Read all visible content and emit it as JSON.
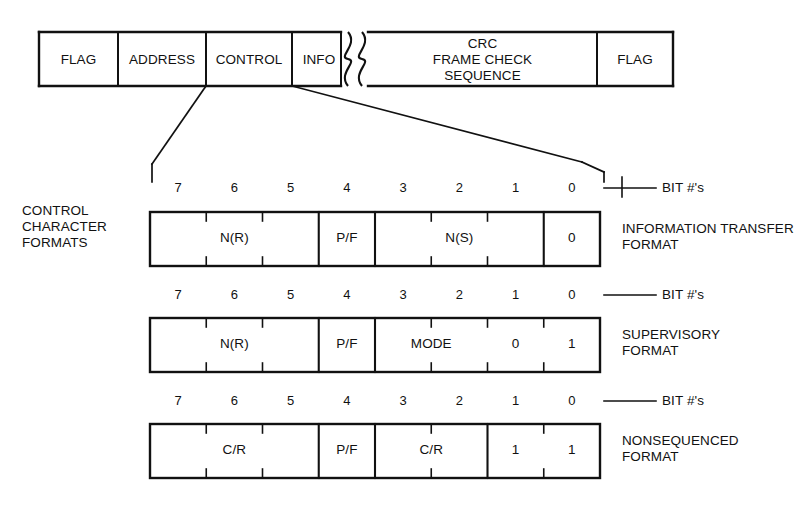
{
  "diagram": {
    "side_title": "CONTROL\nCHARACTER\nFORMATS",
    "bitnum_label": "BIT #'s"
  },
  "frame": {
    "name": "hdlc-frame",
    "fields": [
      {
        "label": "FLAG",
        "x": 39,
        "w": 79
      },
      {
        "label": "ADDRESS",
        "x": 118,
        "w": 88
      },
      {
        "label": "CONTROL",
        "x": 206,
        "w": 86
      },
      {
        "label": "INFO",
        "x": 292,
        "w": 54
      },
      {
        "label": "CRC\nFRAME CHECK\nSEQUENCE",
        "x": 368,
        "w": 229
      },
      {
        "label": "FLAG",
        "x": 597,
        "w": 76
      }
    ],
    "break_symbol": "wavy-break"
  },
  "bit_numbers": [
    "7",
    "6",
    "5",
    "4",
    "3",
    "2",
    "1",
    "0"
  ],
  "formats": [
    {
      "id": "information-transfer",
      "name": "INFORMATION TRANSFER\nFORMAT",
      "name_line1": "INFORMATION TRANSFER",
      "name_line2": "FORMAT",
      "bitnum_label": "BIT #'s",
      "groups": [
        {
          "label": "N(R)",
          "bits": [
            7,
            6,
            5
          ],
          "span": 3
        },
        {
          "label": "P/F",
          "bits": [
            4
          ],
          "span": 1
        },
        {
          "label": "N(S)",
          "bits": [
            3,
            2,
            1
          ],
          "span": 3
        },
        {
          "label": "0",
          "bits": [
            0
          ],
          "span": 1
        }
      ]
    },
    {
      "id": "supervisory",
      "name": "SUPERVISORY\nFORMAT",
      "name_line1": "SUPERVISORY",
      "name_line2": "FORMAT",
      "bitnum_label": "BIT #'s",
      "groups": [
        {
          "label": "N(R)",
          "bits": [
            7,
            6,
            5
          ],
          "span": 3
        },
        {
          "label": "P/F",
          "bits": [
            4
          ],
          "span": 1
        },
        {
          "label": "MODE",
          "bits": [
            3,
            2
          ],
          "span": 2
        },
        {
          "label": "0",
          "bits": [
            1
          ],
          "span": 1
        },
        {
          "label": "1",
          "bits": [
            0
          ],
          "span": 1
        }
      ]
    },
    {
      "id": "nonsequenced",
      "name": "NONSEQUENCED\nFORMAT",
      "name_line1": "NONSEQUENCED",
      "name_line2": "FORMAT",
      "bitnum_label": "BIT #'s",
      "groups": [
        {
          "label": "C/R",
          "bits": [
            7,
            6,
            5
          ],
          "span": 3
        },
        {
          "label": "P/F",
          "bits": [
            4
          ],
          "span": 1
        },
        {
          "label": "C/R",
          "bits": [
            3,
            2
          ],
          "span": 2
        },
        {
          "label": "1",
          "bits": [
            1
          ],
          "span": 1
        },
        {
          "label": "1",
          "bits": [
            0
          ],
          "span": 1
        }
      ]
    }
  ],
  "colors": {
    "ink": "#111111",
    "paper": "#ffffff"
  }
}
